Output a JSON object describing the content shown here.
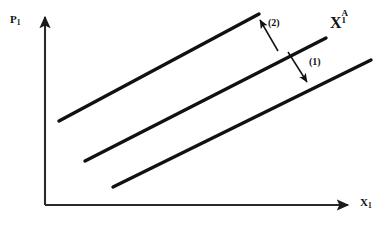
{
  "diagram": {
    "kind": "line",
    "title": "",
    "background_color": "#ffffff",
    "stroke_color": "#111111",
    "axes": {
      "vertical": {
        "name": "price-axis",
        "label_text": "P",
        "label_sub": "1",
        "arrow_direction": "up",
        "x": 45,
        "y_top": 13,
        "y_bottom": 205
      },
      "horizontal": {
        "name": "quantity-axis",
        "label_text": "X",
        "label_sub": "1",
        "arrow_direction": "right",
        "y": 205,
        "x_left": 45,
        "x_right": 352
      }
    },
    "curves": [
      {
        "name": "supply-curve-upper",
        "position": "upper",
        "x1": 59,
        "y1": 121,
        "x2": 259,
        "y2": 14
      },
      {
        "name": "supply-curve-middle",
        "position": "middle",
        "x1": 85,
        "y1": 161,
        "x2": 326,
        "y2": 38
      },
      {
        "name": "supply-curve-lower",
        "position": "lower",
        "x1": 113,
        "y1": 187,
        "x2": 371,
        "y2": 60
      }
    ],
    "curve_label": {
      "name": "curve-label-x1a",
      "base": "X",
      "superscript": "A",
      "subscript": "1"
    },
    "shift_arrows": [
      {
        "name": "shift-arrow-2",
        "label": "(2)",
        "direction": "up-left",
        "tail_x": 278,
        "tail_y": 51,
        "tip_x": 258,
        "tip_y": 17
      },
      {
        "name": "shift-arrow-1",
        "label": "(1)",
        "direction": "down-right",
        "tail_x": 288,
        "tail_y": 52,
        "tip_x": 309,
        "tip_y": 85
      }
    ]
  }
}
